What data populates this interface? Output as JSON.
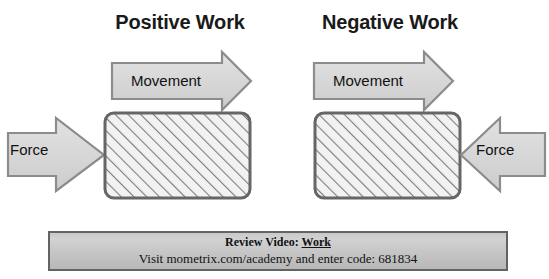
{
  "figure": {
    "type": "diagram",
    "width": 549,
    "height": 279
  },
  "panels": [
    {
      "id": "positive",
      "title": "Positive Work",
      "movement": {
        "label": "Movement",
        "direction": "right",
        "icon": "arrow-right-icon"
      },
      "force": {
        "label": "Force",
        "direction": "right",
        "side": "left",
        "icon": "arrow-right-icon"
      },
      "object": {
        "name": "hatched-block",
        "fill": "diagonal-hatch"
      }
    },
    {
      "id": "negative",
      "title": "Negative Work",
      "movement": {
        "label": "Movement",
        "direction": "right",
        "icon": "arrow-right-icon"
      },
      "force": {
        "label": "Force",
        "direction": "left",
        "side": "right",
        "icon": "arrow-left-icon"
      },
      "object": {
        "name": "hatched-block",
        "fill": "diagonal-hatch"
      }
    }
  ],
  "footer": {
    "line1_prefix": "Review Video: ",
    "line1_link": "Work",
    "line2": "Visit mometrix.com/academy and enter code: 681834"
  },
  "colors": {
    "title_text": "#1a1a1a",
    "label_text": "#111111",
    "arrow_fill": "#d9d9d9",
    "arrow_stroke": "#8c8c8c",
    "block_fill": "#f2f2f2",
    "block_stroke": "#666666",
    "hatch_stroke": "#777777",
    "banner_fill": "#c6c6c6",
    "banner_border": "#636363",
    "page_background": "#ffffff"
  }
}
